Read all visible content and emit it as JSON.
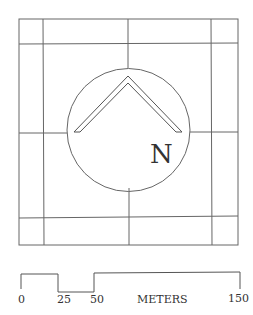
{
  "compass": {
    "label": "N"
  },
  "scale_bar": {
    "ticks": [
      "0",
      "25",
      "50",
      "150"
    ],
    "unit": "METERS"
  },
  "colors": {
    "line": "#555555",
    "text": "#222222"
  }
}
